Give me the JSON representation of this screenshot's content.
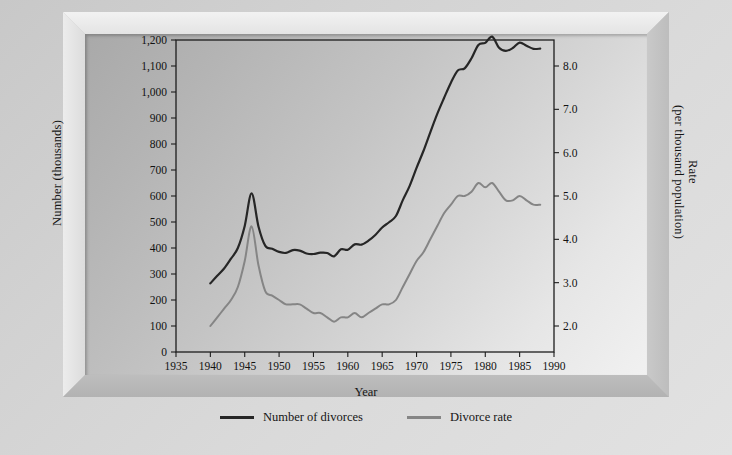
{
  "figure": {
    "frame_style": "beveled-3d-gray"
  },
  "axes": {
    "x": {
      "label": "Year",
      "ticks": [
        "1935",
        "1940",
        "1945",
        "1950",
        "1955",
        "1960",
        "1965",
        "1970",
        "1975",
        "1980",
        "1985",
        "1990"
      ],
      "min": 1935,
      "max": 1990,
      "step": 5
    },
    "y_left": {
      "label": "Number (thousands)",
      "ticks": [
        "0",
        "100",
        "200",
        "300",
        "400",
        "500",
        "600",
        "700",
        "800",
        "900",
        "1,000",
        "1,100",
        "1,200"
      ],
      "min": 0,
      "max": 1200,
      "step": 100
    },
    "y_right": {
      "label_line1": "Rate",
      "label_line2": "(per thousand population)",
      "ticks": [
        "2.0",
        "3.0",
        "4.0",
        "5.0",
        "6.0",
        "7.0",
        "8.0"
      ],
      "min": 1.4,
      "max": 8.6,
      "step": 1.0
    }
  },
  "legend": {
    "position": "bottom-center",
    "entries": [
      {
        "label": "Number of divorces",
        "color": "#262626"
      },
      {
        "label": "Divorce rate",
        "color": "#858585"
      }
    ]
  },
  "colors": {
    "number_line": "#262626",
    "rate_line": "#858585",
    "plot_border": "#1d1d1d",
    "frame": "#c6c6c6",
    "text": "#151515"
  },
  "chart_data": {
    "type": "line",
    "title": "",
    "xlabel": "Year",
    "ylabel": "Number (thousands)",
    "ylabel_secondary": "Rate (per thousand population)",
    "xlim": [
      1935,
      1990
    ],
    "ylim": [
      0,
      1200
    ],
    "ylim_secondary": [
      1.4,
      8.6
    ],
    "grid": false,
    "legend_position": "bottom-center",
    "x": [
      1940,
      1941,
      1942,
      1943,
      1944,
      1945,
      1946,
      1947,
      1948,
      1949,
      1950,
      1951,
      1952,
      1953,
      1954,
      1955,
      1956,
      1957,
      1958,
      1959,
      1960,
      1961,
      1962,
      1963,
      1964,
      1965,
      1966,
      1967,
      1968,
      1969,
      1970,
      1971,
      1972,
      1973,
      1974,
      1975,
      1976,
      1977,
      1978,
      1979,
      1980,
      1981,
      1982,
      1983,
      1984,
      1985,
      1986,
      1987,
      1988
    ],
    "series": [
      {
        "name": "Number of divorces",
        "axis": "left",
        "color": "#262626",
        "units": "thousands",
        "values": [
          264,
          293,
          321,
          359,
          400,
          485,
          610,
          483,
          408,
          397,
          385,
          381,
          392,
          390,
          379,
          377,
          382,
          381,
          368,
          395,
          393,
          414,
          413,
          428,
          450,
          479,
          499,
          523,
          584,
          639,
          708,
          773,
          845,
          915,
          977,
          1036,
          1083,
          1091,
          1130,
          1181,
          1189,
          1213,
          1170,
          1158,
          1169,
          1190,
          1178,
          1166,
          1167
        ]
      },
      {
        "name": "Divorce rate",
        "axis": "right",
        "color": "#858585",
        "units": "per 1,000 population",
        "values": [
          2.0,
          2.2,
          2.4,
          2.6,
          2.9,
          3.5,
          4.3,
          3.4,
          2.8,
          2.7,
          2.6,
          2.5,
          2.5,
          2.5,
          2.4,
          2.3,
          2.3,
          2.2,
          2.1,
          2.2,
          2.2,
          2.3,
          2.2,
          2.3,
          2.4,
          2.5,
          2.5,
          2.6,
          2.9,
          3.2,
          3.5,
          3.7,
          4.0,
          4.3,
          4.6,
          4.8,
          5.0,
          5.0,
          5.1,
          5.3,
          5.2,
          5.3,
          5.1,
          4.9,
          4.9,
          5.0,
          4.9,
          4.8,
          4.8
        ]
      }
    ],
    "annotations": {
      "postwar_peak_year": 1946,
      "modern_peak_year": 1981
    }
  }
}
